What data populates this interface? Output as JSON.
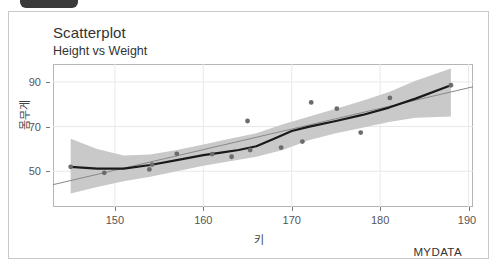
{
  "window": {
    "badge_label": ""
  },
  "card": {
    "title": "Scatterplot",
    "subtitle": "Height vs Weight",
    "caption": "MYDATA"
  },
  "colors": {
    "point": "#6b6b6b",
    "loess_line": "#1a1a1a",
    "regression_line": "#888888",
    "confidence_band": "#c9c9c9",
    "panel_border": "#b5b5b5",
    "card_border": "#c8c8c8",
    "text": "#333333",
    "badge": "#3a3a3a"
  },
  "chart_data": {
    "type": "scatter",
    "title": "Scatterplot",
    "subtitle": "Height vs Weight",
    "xlabel": "키",
    "ylabel": "몸무게",
    "caption": "MYDATA",
    "grid": true,
    "legend": "none",
    "xlim": [
      143.0,
      190.5
    ],
    "ylim": [
      34,
      98
    ],
    "xticks": [
      150,
      160,
      170,
      180,
      190
    ],
    "yticks": [
      50,
      70,
      90
    ],
    "points": [
      {
        "x": 145.0,
        "y": 52.0
      },
      {
        "x": 148.8,
        "y": 49.3
      },
      {
        "x": 153.9,
        "y": 50.8
      },
      {
        "x": 154.2,
        "y": 53.0
      },
      {
        "x": 157.0,
        "y": 57.8
      },
      {
        "x": 161.0,
        "y": 57.7
      },
      {
        "x": 163.2,
        "y": 56.5
      },
      {
        "x": 165.0,
        "y": 72.5
      },
      {
        "x": 165.3,
        "y": 59.5
      },
      {
        "x": 168.8,
        "y": 60.6
      },
      {
        "x": 171.2,
        "y": 63.3
      },
      {
        "x": 172.2,
        "y": 80.8
      },
      {
        "x": 175.1,
        "y": 78.0
      },
      {
        "x": 177.8,
        "y": 67.3
      },
      {
        "x": 181.1,
        "y": 82.8
      },
      {
        "x": 188.0,
        "y": 88.5
      }
    ],
    "series": [
      {
        "name": "loess smooth",
        "type": "line",
        "x": [
          145.0,
          148.0,
          151.0,
          154.0,
          157.0,
          160.0,
          162.0,
          164.0,
          166.0,
          168.0,
          170.0,
          172.0,
          175.0,
          178.0,
          181.0,
          184.0,
          188.0
        ],
        "y": [
          52.0,
          51.2,
          51.2,
          52.8,
          55.0,
          57.2,
          58.3,
          59.5,
          61.2,
          64.5,
          68.0,
          70.0,
          72.5,
          75.2,
          78.5,
          82.5,
          88.5
        ]
      },
      {
        "name": "linear fit",
        "type": "line",
        "x": [
          143.0,
          190.5
        ],
        "y": [
          44.0,
          87.8
        ]
      },
      {
        "name": "confidence band upper",
        "type": "band",
        "x": [
          145.0,
          148.0,
          151.0,
          154.0,
          157.0,
          160.0,
          163.0,
          166.0,
          169.0,
          172.0,
          175.0,
          178.0,
          181.0,
          184.0,
          188.0
        ],
        "y": [
          64.5,
          60.0,
          57.0,
          57.5,
          59.5,
          62.0,
          64.5,
          67.0,
          71.0,
          74.5,
          78.0,
          81.5,
          85.5,
          90.5,
          96.0
        ]
      },
      {
        "name": "confidence band lower",
        "type": "band",
        "x": [
          145.0,
          148.0,
          151.0,
          154.0,
          157.0,
          160.0,
          163.0,
          166.0,
          169.0,
          172.0,
          175.0,
          178.0,
          181.0,
          184.0,
          188.0
        ],
        "y": [
          40.0,
          43.0,
          45.5,
          47.5,
          50.0,
          52.5,
          54.5,
          56.5,
          59.5,
          64.0,
          67.0,
          69.5,
          72.0,
          74.0,
          74.5
        ]
      }
    ]
  }
}
